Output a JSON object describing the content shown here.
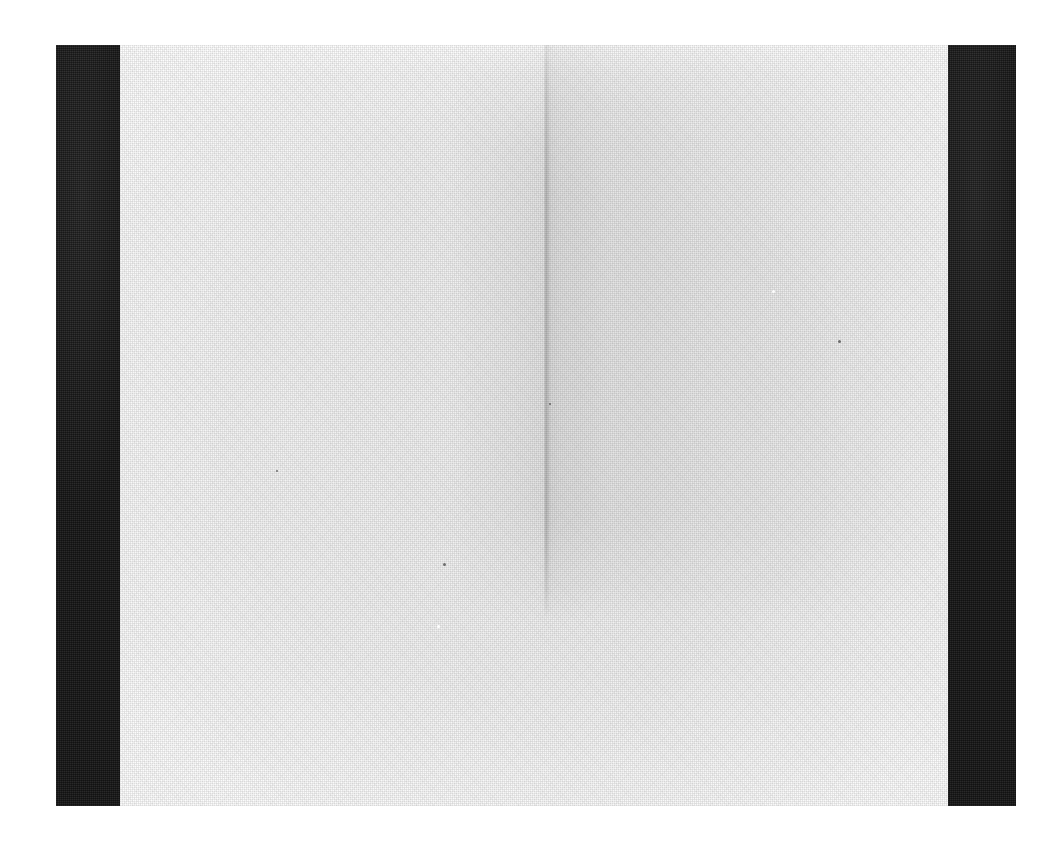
{
  "image": {
    "kind": "scanned-blank-page",
    "caption": "Scan of a blank light-grey sheet flanked by two solid black vertical bars",
    "width_px": 1062,
    "height_px": 849
  },
  "canvas": {
    "background_color": "#ffffff"
  },
  "paper": {
    "label": "scanned paper sheet",
    "base_color": "#e9e9e9",
    "left_px": 120,
    "top_px": 45,
    "width_px": 828,
    "height_px": 761,
    "texture": "fine halftone paper grain",
    "tone_note": "lighter at top edge and toward the corners, mid-grey through the centre"
  },
  "crease": {
    "label": "vertical fold crease",
    "x_px": 545,
    "top_px": 45,
    "bottom_px": 620,
    "shadow_color": "#8c8c8c",
    "shadow_side": "right",
    "note": "thin dark vertical edge with a broad darker panel to its right, fading out about two thirds down the sheet"
  },
  "bars": [
    {
      "name": "left-black-bar",
      "color": "#1a1a1a",
      "left_px": 56,
      "top_px": 45,
      "width_px": 64,
      "height_px": 761
    },
    {
      "name": "right-black-bar",
      "color": "#1a1a1a",
      "left_px": 948,
      "top_px": 45,
      "width_px": 68,
      "height_px": 761
    }
  ],
  "specks": [
    {
      "name": "speck-dark-upper-right",
      "x_px": 838,
      "y_px": 340,
      "size_px": 3,
      "tone": "dark"
    },
    {
      "name": "speck-dark-mid-left",
      "x_px": 443,
      "y_px": 563,
      "size_px": 3,
      "tone": "dark"
    },
    {
      "name": "speck-light-mid-left",
      "x_px": 437,
      "y_px": 625,
      "size_px": 3,
      "tone": "light"
    },
    {
      "name": "speck-dark-crease",
      "x_px": 549,
      "y_px": 403,
      "size_px": 2,
      "tone": "dark"
    },
    {
      "name": "speck-light-upper-right",
      "x_px": 772,
      "y_px": 290,
      "size_px": 3,
      "tone": "light"
    },
    {
      "name": "speck-dark-lower-left",
      "x_px": 276,
      "y_px": 470,
      "size_px": 2,
      "tone": "dark"
    }
  ]
}
